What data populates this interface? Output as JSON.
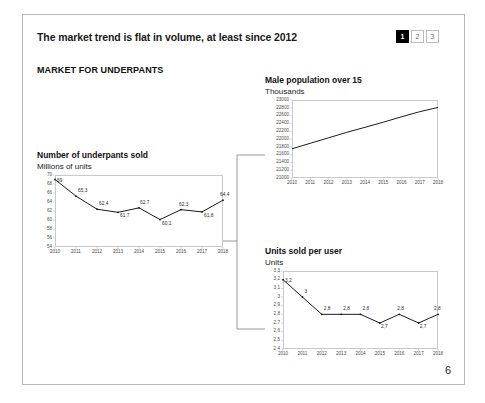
{
  "slide": {
    "headline": "The market trend is flat in volume, at least since 2012",
    "subhead": "MARKET FOR UNDERPANTS",
    "page_number": "6",
    "page_nav": [
      {
        "label": "1",
        "active": true
      },
      {
        "label": "2",
        "active": false
      },
      {
        "label": "3",
        "active": false
      }
    ],
    "line_color": "#1a1a1a",
    "axis_color": "#c9c9c9"
  },
  "chart_data": [
    {
      "id": "underpants-sold",
      "type": "line",
      "title": "Number of underpants sold",
      "subtitle": "Millions of units",
      "xlabel": "",
      "ylabel": "Millions of units",
      "categories": [
        "2010",
        "2011",
        "2012",
        "2013",
        "2014",
        "2015",
        "2016",
        "2017",
        "2018"
      ],
      "values": [
        69,
        65.3,
        62.4,
        61.7,
        62.7,
        60.1,
        62.3,
        61.8,
        64.4
      ],
      "labels": [
        "69",
        "65,3",
        "62,4",
        "61,7",
        "62,7",
        "60,1",
        "62,3",
        "61,8",
        "64,4"
      ],
      "yticks": [
        "70",
        "68",
        "66",
        "64",
        "62",
        "60",
        "58",
        "56",
        "54"
      ],
      "ytick_values": [
        70,
        68,
        66,
        64,
        62,
        60,
        58,
        56,
        54
      ],
      "ylim": [
        54,
        70
      ],
      "grid": false,
      "legend": "none"
    },
    {
      "id": "male-population",
      "type": "line",
      "title": "Male population over 15",
      "subtitle": "Thousands",
      "xlabel": "",
      "ylabel": "Thousands",
      "categories": [
        "2010",
        "2011",
        "2012",
        "2013",
        "2014",
        "2015",
        "2016",
        "2017",
        "2018"
      ],
      "values": [
        21750,
        21890,
        22030,
        22170,
        22300,
        22430,
        22570,
        22700,
        22810
      ],
      "labels": [],
      "yticks": [
        "23000",
        "22800",
        "22600",
        "22400",
        "22200",
        "22000",
        "21800",
        "21600",
        "21400",
        "21200",
        "21000"
      ],
      "ytick_values": [
        23000,
        22800,
        22600,
        22400,
        22200,
        22000,
        21800,
        21600,
        21400,
        21200,
        21000
      ],
      "ylim": [
        21000,
        23000
      ],
      "grid": false,
      "legend": "none"
    },
    {
      "id": "units-per-user",
      "type": "line",
      "title": "Units sold per user",
      "subtitle": "Units",
      "xlabel": "",
      "ylabel": "Units",
      "categories": [
        "2010",
        "2011",
        "2012",
        "2013",
        "2014",
        "2015",
        "2016",
        "2017",
        "2018"
      ],
      "values": [
        3.2,
        3.0,
        2.8,
        2.8,
        2.8,
        2.7,
        2.8,
        2.7,
        2.8
      ],
      "labels": [
        "3,2",
        "3",
        "2,8",
        "2,8",
        "2,8",
        "2,7",
        "2,8",
        "2,7",
        "2,8"
      ],
      "yticks": [
        "3,3",
        "3,2",
        "3,1",
        "3",
        "2,9",
        "2,8",
        "2,7",
        "2,6",
        "2,5",
        "2,4"
      ],
      "ytick_values": [
        3.3,
        3.2,
        3.1,
        3.0,
        2.9,
        2.8,
        2.7,
        2.6,
        2.5,
        2.4
      ],
      "ylim": [
        2.4,
        3.3
      ],
      "grid": false,
      "legend": "none"
    }
  ]
}
